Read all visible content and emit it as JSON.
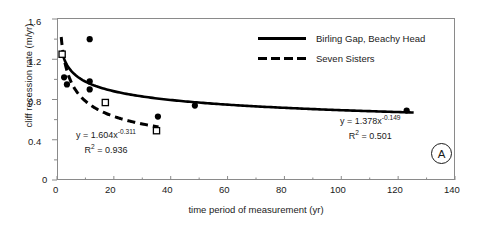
{
  "chart_data": {
    "type": "scatter",
    "title": "",
    "xlabel": "time period of measurement (yr)",
    "ylabel": "cliff recession rate (m/yr)",
    "xlim": [
      0,
      140
    ],
    "ylim": [
      0,
      1.6
    ],
    "xticks": [
      0,
      20,
      40,
      60,
      80,
      100,
      120,
      140
    ],
    "yticks": [
      0,
      0.4,
      0.8,
      1.2,
      1.6
    ],
    "xtick_labels": [
      "0",
      "20",
      "40",
      "60",
      "80",
      "100",
      "120",
      "140"
    ],
    "ytick_labels": [
      "0",
      "0.4",
      "0.8",
      "1.2",
      "1.6"
    ],
    "x_minor_interval": 10,
    "y_minor_interval": 0.2,
    "grid": false,
    "legend_position": "top-right",
    "panel_label": "A",
    "series": [
      {
        "name": "Birling Gap, Beachy Head",
        "marker": "filled-circle",
        "line": "solid",
        "equation": "y = 1.378x",
        "exponent": "-0.149",
        "r2_label": "R",
        "r2_exp": "2",
        "r2_value": "= 0.501",
        "fit": {
          "a": 1.378,
          "b": -0.149,
          "r2": 0.501
        },
        "points": [
          {
            "x": 2.5,
            "y": 1.02
          },
          {
            "x": 3.5,
            "y": 0.95
          },
          {
            "x": 11.5,
            "y": 1.4
          },
          {
            "x": 11.5,
            "y": 0.98
          },
          {
            "x": 11.5,
            "y": 0.9
          },
          {
            "x": 35.5,
            "y": 0.63
          },
          {
            "x": 48.5,
            "y": 0.74
          },
          {
            "x": 123.0,
            "y": 0.69
          }
        ]
      },
      {
        "name": "Seven Sisters",
        "marker": "open-square",
        "line": "dashed",
        "equation": "y = 1.604x",
        "exponent": "-0.311",
        "r2_label": "R",
        "r2_exp": "2",
        "r2_value": "= 0.936",
        "fit": {
          "a": 1.604,
          "b": -0.311,
          "r2": 0.936
        },
        "points": [
          {
            "x": 1.8,
            "y": 1.25
          },
          {
            "x": 17.0,
            "y": 0.77
          },
          {
            "x": 35.0,
            "y": 0.49
          }
        ]
      }
    ]
  },
  "colors": {
    "line": "#000000",
    "axis": "#8a8a8a",
    "text": "#1a1a1a",
    "background": "#ffffff"
  }
}
